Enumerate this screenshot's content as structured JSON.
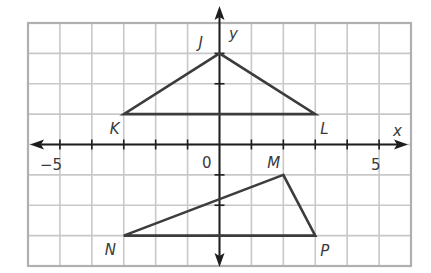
{
  "axes": {
    "x_label": "x",
    "y_label": "y",
    "origin_label": "0",
    "x_tick_labels": [
      {
        "value": -5,
        "text": "−5"
      },
      {
        "value": 5,
        "text": "5"
      }
    ],
    "x_range": [
      -6,
      6
    ],
    "y_range": [
      -4,
      4
    ]
  },
  "triangles": [
    {
      "name": "JKL",
      "vertices": [
        {
          "label": "J",
          "x": 0,
          "y": 3
        },
        {
          "label": "K",
          "x": -3,
          "y": 1
        },
        {
          "label": "L",
          "x": 3,
          "y": 1
        }
      ]
    },
    {
      "name": "MNP",
      "vertices": [
        {
          "label": "M",
          "x": 2,
          "y": -1
        },
        {
          "label": "N",
          "x": -3,
          "y": -3
        },
        {
          "label": "P",
          "x": 3,
          "y": -3
        }
      ]
    }
  ],
  "colors": {
    "grid": "#c8c8c8",
    "border": "#b0b0b0",
    "axis": "#1e1e1e",
    "shape": "#3c3c3c",
    "text": "#3a3a3a"
  }
}
